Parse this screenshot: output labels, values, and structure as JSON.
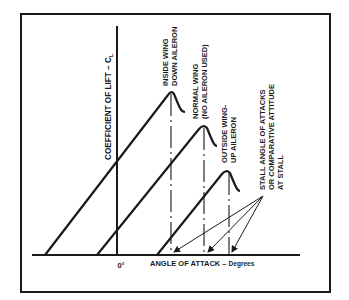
{
  "diagram": {
    "type": "lift-curve-diagram",
    "y_axis": {
      "label": "COEFFICIENT OF LIFT – C",
      "subscript": "L"
    },
    "x_axis": {
      "label": "ANGLE OF ATTACK – ",
      "unit": "Degrees",
      "origin_label": "0°"
    },
    "curves": [
      {
        "id": "inside-wing",
        "label_line1": "INSIDE WING",
        "label_line2": "DOWN AILERON"
      },
      {
        "id": "normal-wing",
        "label_line1": "NORMAL WING",
        "label_line2": "(NO AILERON USED)"
      },
      {
        "id": "outside-wing",
        "label_line1": "OUTSIDE WING-",
        "label_line2": "UP AILERON"
      }
    ],
    "annotation": {
      "line1": "STALL ANGLE OF ATTACKS",
      "line2": "OR COMPARATIVE ATTITUDE",
      "line3": "AT STALL"
    },
    "colors": {
      "ink": "#1a1a1a",
      "background": "#ffffff"
    }
  }
}
